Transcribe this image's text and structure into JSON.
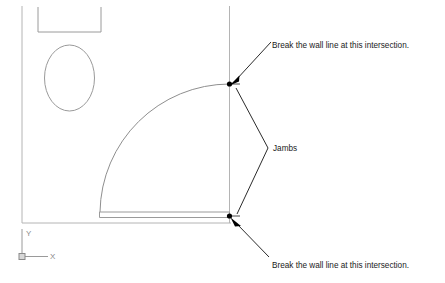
{
  "drawing": {
    "title": "Door jamb wall-break detail",
    "background_color": "#ffffff",
    "line_color": "#b4b4b4",
    "annotation_color": "#1a1a1a",
    "node_color": "#000000"
  },
  "annotations": {
    "top_note": "Break the wall line at this intersection.",
    "jambs_label": "Jambs",
    "bottom_note": "Break the wall line at this intersection."
  },
  "ucs_icon": {
    "x_label": "X",
    "y_label": "Y"
  },
  "geometry": {
    "left_wall_label": "left wall line",
    "right_wall_label": "right wall line",
    "bottom_wall_label": "bottom wall line",
    "toilet_label": "toilet fixture",
    "door_arc_label": "door swing arc",
    "door_panel_label": "door panel",
    "top_jamb_label": "top jamb node",
    "bottom_jamb_label": "bottom jamb node"
  }
}
